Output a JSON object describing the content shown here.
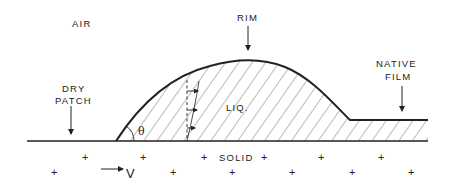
{
  "diagram": {
    "labels": {
      "air": "AIR",
      "rim": "RIM",
      "dry_patch_line1": "DRY",
      "dry_patch_line2": "PATCH",
      "native_film_line1": "NATIVE",
      "native_film_line2": "FILM",
      "liquid": "LIQ.",
      "solid": "SOLID",
      "velocity": "V",
      "contact_angle": "θ"
    },
    "colors": {
      "stroke": "#222222",
      "hatch": "#555555",
      "background": "#ffffff"
    },
    "solid_markers": {
      "symbol": "+",
      "row1": [
        86,
        144,
        205,
        265,
        322,
        382
      ],
      "row2": [
        55,
        174,
        233,
        293,
        353,
        412
      ]
    }
  }
}
